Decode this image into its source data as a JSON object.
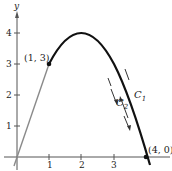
{
  "figure": {
    "axes": {
      "x_axis_label": "",
      "y_axis_label": "y",
      "x_ticks": [
        "1",
        "2",
        "3"
      ],
      "y_ticks": [
        "1",
        "2",
        "3",
        "4"
      ]
    },
    "points": [
      {
        "label": "(1, 3)",
        "x": 1,
        "y": 3
      },
      {
        "label": "(4, 0)",
        "x": 4,
        "y": 0
      }
    ],
    "curves": [
      {
        "name": "line",
        "equation": "y = 3x",
        "from": [
          0,
          0
        ],
        "to": [
          1,
          3
        ],
        "color": "#808080"
      },
      {
        "name": "parabola",
        "equation": "y = 4x - x^2",
        "from": [
          1,
          3
        ],
        "to": [
          4,
          0
        ],
        "color": "#111111"
      }
    ],
    "curve_labels": {
      "c1": "C",
      "c1_sub": "1",
      "c2": "C",
      "c2_sub": "2"
    },
    "colors": {
      "axis": "#555555",
      "line": "#8a8a8a",
      "curve": "#111111"
    }
  }
}
